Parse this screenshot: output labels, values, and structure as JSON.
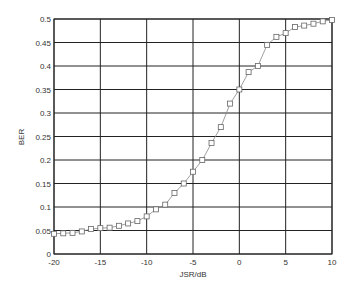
{
  "chart_data": {
    "type": "line",
    "title": "",
    "xlabel": "JSR/dB",
    "ylabel": "BER",
    "xlim": [
      -20,
      10
    ],
    "ylim": [
      0,
      0.5
    ],
    "grid": true,
    "legend": null,
    "x_ticks": [
      -20,
      -15,
      -10,
      -5,
      0,
      5,
      10
    ],
    "x_tick_labels": [
      "-20",
      "-15",
      "-10",
      "-5",
      "0",
      "5",
      "10"
    ],
    "y_ticks": [
      0,
      0.05,
      0.1,
      0.15,
      0.2,
      0.25,
      0.3,
      0.35,
      0.4,
      0.45,
      0.5
    ],
    "y_tick_labels": [
      "0",
      "0.05",
      "0.1",
      "0.15",
      "0.2",
      "0.25",
      "0.3",
      "0.35",
      "0.4",
      "0.45",
      "0.5"
    ],
    "series": [
      {
        "name": "BER",
        "marker": "square",
        "color": "#777777",
        "x": [
          -20,
          -19,
          -18,
          -17,
          -16,
          -15,
          -14,
          -13,
          -12,
          -11,
          -10,
          -9,
          -8,
          -7,
          -6,
          -5,
          -4,
          -3,
          -2,
          -1,
          0,
          1,
          2,
          3,
          4,
          5,
          6,
          7,
          8,
          9,
          10
        ],
        "y": [
          0.043,
          0.044,
          0.045,
          0.048,
          0.053,
          0.055,
          0.056,
          0.06,
          0.065,
          0.07,
          0.08,
          0.095,
          0.105,
          0.13,
          0.15,
          0.175,
          0.2,
          0.236,
          0.27,
          0.32,
          0.35,
          0.387,
          0.4,
          0.445,
          0.462,
          0.47,
          0.483,
          0.486,
          0.49,
          0.495,
          0.498
        ]
      }
    ]
  },
  "colors": {
    "grid": "#222222",
    "frame": "#222222",
    "line": "#888888",
    "marker": "#666666"
  }
}
